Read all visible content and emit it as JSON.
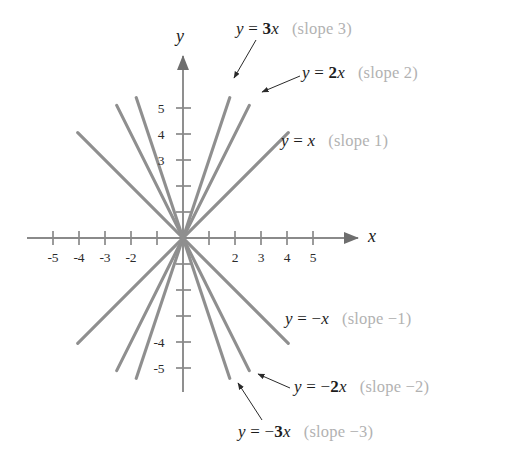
{
  "figure": {
    "background_color": "#ffffff",
    "line_color": "#8f8f8f",
    "axis_color": "#7a7a7a",
    "equation_color": "#1c1c1c",
    "slope_note_color": "#b2b2b2"
  },
  "axes": {
    "x_axis_label": "x",
    "y_axis_label": "y",
    "x_tick_labels": [
      "-5",
      "-4",
      "-3",
      "-2",
      "2",
      "3",
      "4",
      "5"
    ],
    "y_tick_labels": [
      "5",
      "4",
      "3",
      "-4",
      "-5"
    ],
    "x_range": [
      -6,
      6.2
    ],
    "y_range": [
      -6.2,
      6
    ],
    "grid": false,
    "origin_px": [
      183,
      238
    ],
    "unit_px": 26
  },
  "chart_data": {
    "type": "line",
    "title": "",
    "xlabel": "x",
    "ylabel": "y",
    "xlim": [
      -6,
      6.2
    ],
    "ylim": [
      -6.2,
      6
    ],
    "grid": false,
    "legend": "annotations",
    "series": [
      {
        "name": "y = 3x",
        "slope": 3,
        "equation_html": "y <span class=\"op\">=</span> <span class=\"coef\">3</span>x",
        "slope_note": "(slope 3)",
        "x": [
          -1.8,
          1.8
        ],
        "y": [
          -5.4,
          5.4
        ]
      },
      {
        "name": "y = 2x",
        "slope": 2,
        "equation_html": "y <span class=\"op\">=</span> <span class=\"coef\">2</span>x",
        "slope_note": "(slope 2)",
        "x": [
          -2.55,
          2.55
        ],
        "y": [
          -5.1,
          5.1
        ]
      },
      {
        "name": "y = x",
        "slope": 1,
        "equation_html": "y <span class=\"op\">=</span> x",
        "slope_note": "(slope 1)",
        "x": [
          -4.05,
          4.05
        ],
        "y": [
          -4.05,
          4.05
        ]
      },
      {
        "name": "y = -x",
        "slope": -1,
        "equation_html": "y <span class=\"op\">= −</span>x",
        "slope_note": "(slope −1)",
        "x": [
          -4.05,
          4.05
        ],
        "y": [
          4.05,
          -4.05
        ]
      },
      {
        "name": "y = -2x",
        "slope": -2,
        "equation_html": "y <span class=\"op\">= −</span><span class=\"coef\">2</span>x",
        "slope_note": "(slope −2)",
        "x": [
          -2.55,
          2.55
        ],
        "y": [
          5.1,
          -5.1
        ]
      },
      {
        "name": "y = -3x",
        "slope": -3,
        "equation_html": "y <span class=\"op\">= −</span><span class=\"coef\">3</span>x",
        "slope_note": "(slope −3)",
        "x": [
          -1.8,
          1.8
        ],
        "y": [
          5.4,
          -5.4
        ]
      }
    ]
  },
  "annotations": [
    {
      "id": "label-3x",
      "equation": "y = 3x",
      "slope_note": "(slope 3)",
      "left": 236,
      "top": 20,
      "leader": true
    },
    {
      "id": "label-2x",
      "equation": "y = 2x",
      "slope_note": "(slope 2)",
      "left": 302,
      "top": 64,
      "leader": true
    },
    {
      "id": "label-x",
      "equation": "y = x",
      "slope_note": "(slope 1)",
      "left": 281,
      "top": 132,
      "leader": false
    },
    {
      "id": "label-neg-x",
      "equation": "y = −x",
      "slope_note": "(slope −1)",
      "left": 285,
      "top": 310,
      "leader": false
    },
    {
      "id": "label-neg-2x",
      "equation": "y = −2x",
      "slope_note": "(slope −2)",
      "left": 294,
      "top": 378,
      "leader": true
    },
    {
      "id": "label-neg-3x",
      "equation": "y = −3x",
      "slope_note": "(slope −3)",
      "left": 238,
      "top": 423,
      "leader": true
    }
  ]
}
